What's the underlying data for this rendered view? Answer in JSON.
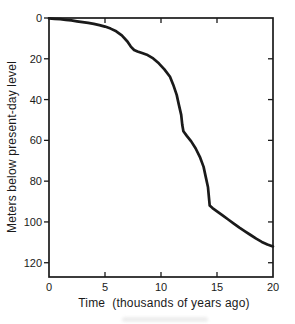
{
  "figure": {
    "background": "#ffffff",
    "ink_color": "#1a1a1a"
  },
  "chart_data": {
    "type": "line",
    "title": "",
    "xlabel": "Time  (thousands of years ago)",
    "ylabel": "Meters below present-day level",
    "x_range": [
      0,
      20
    ],
    "y_range": [
      0,
      127
    ],
    "y_axis_inverted": true,
    "grid": false,
    "legend": null,
    "x_ticks": [
      0,
      5,
      10,
      15,
      20
    ],
    "x_tick_labels": [
      "0",
      "5",
      "10",
      "15",
      "20"
    ],
    "y_ticks": [
      0,
      20,
      40,
      60,
      80,
      100,
      120
    ],
    "y_tick_labels": [
      "0",
      "20",
      "40",
      "60",
      "80",
      "100",
      "120"
    ],
    "top_inner_ticks": [
      5,
      10,
      15
    ],
    "right_inner_ticks": [
      20,
      40,
      60,
      80,
      100,
      120
    ],
    "series": [
      {
        "name": "sea-level-depth-curve",
        "color": "#1a1a1a",
        "x": [
          0,
          0.5,
          1,
          1.5,
          2,
          2.5,
          3,
          3.5,
          4,
          4.5,
          5,
          5.5,
          6,
          6.5,
          7,
          7.3,
          7.6,
          7.9,
          8.3,
          8.8,
          9.3,
          9.8,
          10.3,
          10.8,
          11.1,
          11.4,
          11.6,
          11.8,
          11.9,
          12.0,
          12.3,
          12.7,
          13.1,
          13.5,
          13.8,
          14.0,
          14.2,
          14.35,
          14.6,
          15.0,
          15.5,
          16.0,
          16.5,
          17.0,
          17.5,
          18.0,
          18.5,
          19.0,
          19.5,
          20.0
        ],
        "y": [
          0.2,
          0.4,
          0.6,
          0.9,
          1.2,
          1.6,
          2.0,
          2.4,
          2.9,
          3.5,
          4.2,
          5.2,
          6.5,
          8.5,
          11.5,
          14.0,
          15.7,
          16.4,
          17.2,
          18.2,
          19.8,
          22.2,
          25.2,
          28.8,
          32.8,
          37.7,
          42.6,
          47.5,
          52.5,
          55.5,
          57.8,
          60.5,
          64.0,
          68.5,
          73.0,
          78.0,
          83.0,
          92.0,
          93.2,
          94.8,
          96.8,
          98.8,
          100.8,
          102.8,
          104.6,
          106.4,
          108.2,
          109.8,
          111.0,
          112.0
        ]
      }
    ]
  }
}
